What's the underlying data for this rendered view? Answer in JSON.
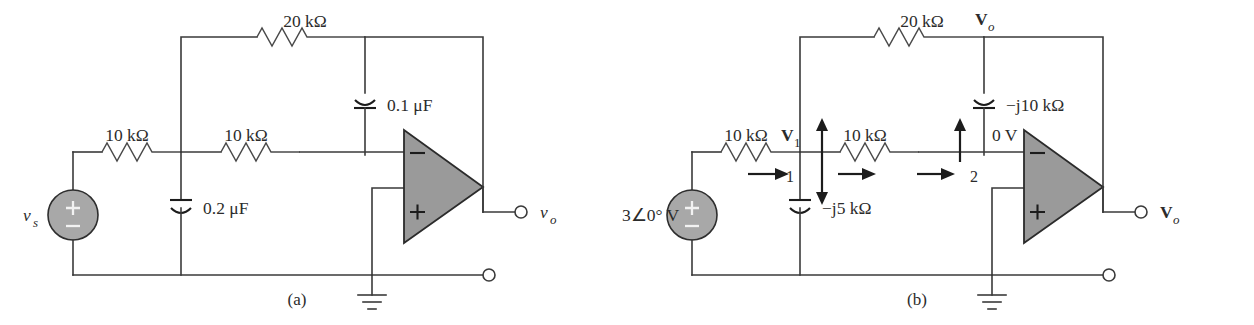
{
  "figure": {
    "background": "#ffffff",
    "line_color": "#3a3a3a",
    "fill_gray": "#a8a8a8",
    "opamp_gray": "#9a9a9a"
  },
  "panel_a": {
    "caption": "(a)",
    "source_label": "v",
    "source_sub": "s",
    "source_plus": "+",
    "source_minus": "−",
    "r_input": "10 kΩ",
    "r_series": "10 kΩ",
    "r_feedback": "20 kΩ",
    "c_shunt": "0.2 μF",
    "c_feedback": "0.1 μF",
    "opamp_inv": "−",
    "opamp_non_inv": "+",
    "out_label": "v",
    "out_sub": "o"
  },
  "panel_b": {
    "caption": "(b)",
    "source_label": "3∠0° V",
    "source_mag": "3",
    "source_angle": "0°",
    "source_unit": "V",
    "source_plus": "+",
    "source_minus": "−",
    "r_input": "10 kΩ",
    "r_series": "10 kΩ",
    "r_feedback": "20 kΩ",
    "c_shunt": "−j5 kΩ",
    "c_feedback": "−j10 kΩ",
    "node1_voltage": "V",
    "node1_voltage_sub": "1",
    "node1_number": "1",
    "node2_number": "2",
    "node2_voltage": "0 V",
    "out_node_label": "V",
    "out_node_sub": "o",
    "opamp_inv": "−",
    "opamp_non_inv": "+",
    "out_label": "V",
    "out_sub": "o"
  }
}
